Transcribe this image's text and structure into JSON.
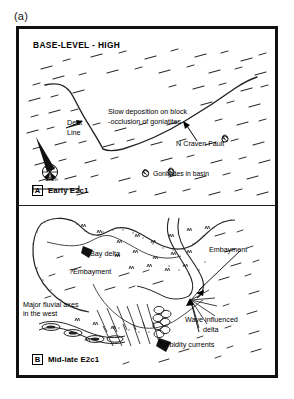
{
  "figure": {
    "label": "(a)",
    "caption_none": ""
  },
  "panel_a": {
    "tag_letter": "A",
    "tag_label": "Early E2c1",
    "heading": "BASE-LEVEL - HIGH",
    "annotations": {
      "slow_deposition_line1": "Slow deposition on block",
      "slow_deposition_line2": "-occlusion of goniatites",
      "dent_line_1": "Dent",
      "dent_line_2": "Line",
      "n_craven_fault": "N Craven Fault"
    },
    "legend": {
      "goniatites": "Goniatites in basin",
      "goniatite_symbol": "goniatite-ammonoid-icon"
    },
    "scale_bar": {
      "length_label": "10km"
    },
    "compass": {
      "symbol": "compass-rose-icon"
    }
  },
  "panel_b": {
    "tag_letter": "B",
    "tag_label": "Mid-late E2c1",
    "annotations": {
      "bay_delta": "Bay delta",
      "q_embayment": "?Embayment",
      "embayment": "Embayment",
      "major_fluvial_line1": "Major fluvial axes",
      "major_fluvial_line2": "in the west",
      "wave_delta_line1": "Wave influenced",
      "wave_delta_line2": "delta",
      "turbidity_currents": "Turbidity currents"
    }
  },
  "colors": {
    "ink": "#000000",
    "frame": "#111111",
    "paper": "#ffffff",
    "hachure": "#2b2b2b",
    "stipple": "#555555"
  }
}
